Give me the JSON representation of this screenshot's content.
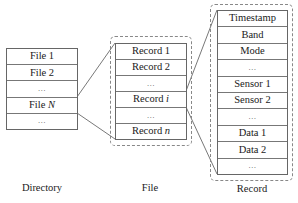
{
  "directory": {
    "caption": "Directory",
    "rows": [
      "File 1",
      "File 2",
      "…",
      "File N",
      "…"
    ]
  },
  "file": {
    "caption": "File",
    "rows": [
      "Record 1",
      "Record 2",
      "…",
      "Record i",
      "…",
      "Record n"
    ]
  },
  "record": {
    "caption": "Record",
    "rows": [
      "Timestamp",
      "Band",
      "Mode",
      "…",
      "Sensor 1",
      "Sensor 2",
      "…",
      "Data 1",
      "Data 2",
      "…"
    ]
  },
  "colors": {
    "line": "#555555",
    "border": "#666666",
    "dashed": "#888888"
  }
}
